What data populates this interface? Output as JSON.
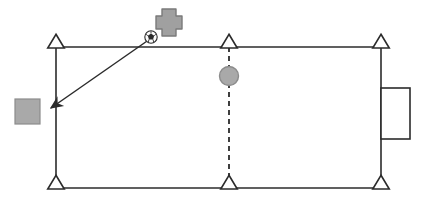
{
  "figure": {
    "title": "",
    "background_color": "#ffffff",
    "width": 424,
    "height": 206
  },
  "style": {
    "stroke_color": "#2b2b2b",
    "stroke_width": 1.6,
    "fill_gray": "#a9a9a9",
    "fill_gray_dark": "#8c8c8c",
    "marker_fill": "#ffffff",
    "dash_pattern": "5,4"
  },
  "frame": {
    "label": "rectangular-frame",
    "top_line_y": 47,
    "bottom_line_y": 188,
    "left_line_x": 56,
    "right_line_x": 381
  },
  "supports": [
    {
      "name": "support-top-left",
      "x": 56,
      "y": 47,
      "orientation": "up",
      "size": 15
    },
    {
      "name": "support-top-middle",
      "x": 229,
      "y": 47,
      "orientation": "up",
      "size": 15
    },
    {
      "name": "support-top-right",
      "x": 381,
      "y": 47,
      "orientation": "up",
      "size": 15
    },
    {
      "name": "support-bottom-left",
      "x": 56,
      "y": 188,
      "orientation": "up",
      "size": 15
    },
    {
      "name": "support-bottom-middle",
      "x": 229,
      "y": 188,
      "orientation": "up",
      "size": 15
    },
    {
      "name": "support-bottom-right",
      "x": 381,
      "y": 188,
      "orientation": "up",
      "size": 15
    }
  ],
  "elements": {
    "gray_square": {
      "name": "gray-square-node",
      "x": 15,
      "y": 99,
      "width": 25,
      "height": 25,
      "fill": "#a9a9a9",
      "stroke": "#8c8c8c"
    },
    "gray_circle": {
      "name": "gray-circle-node",
      "cx": 229,
      "cy": 76,
      "r": 10,
      "fill": "#a9a9a9",
      "stroke": "#8c8c8c"
    },
    "cross": {
      "name": "gray-cross-marker",
      "cx": 169,
      "cy": 22,
      "arm": 7,
      "half": 14,
      "fill": "#a0a0a0",
      "stroke": "#7a7a7a"
    },
    "soccer_ball": {
      "name": "soccer-ball-icon",
      "cx": 151,
      "cy": 37,
      "r": 6
    },
    "arrow": {
      "name": "direction-arrow",
      "x1": 151,
      "y1": 38,
      "x2": 50,
      "y2": 109
    },
    "dashed_connector": {
      "name": "dashed-connector-line",
      "x": 229,
      "y1": 47,
      "y2": 188
    },
    "right_rectangle": {
      "name": "right-side-rectangle",
      "x": 381,
      "y": 88,
      "width": 29,
      "height": 51
    }
  }
}
